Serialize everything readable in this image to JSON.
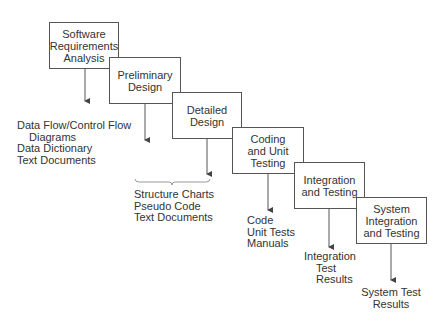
{
  "diagram": {
    "type": "waterfall-process",
    "stages": [
      {
        "id": "s1",
        "lines": [
          "Software",
          "Requirements",
          "Analysis"
        ]
      },
      {
        "id": "s2",
        "lines": [
          "Preliminary",
          "Design"
        ]
      },
      {
        "id": "s3",
        "lines": [
          "Detailed",
          "Design"
        ]
      },
      {
        "id": "s4",
        "lines": [
          "Coding",
          "and Unit",
          "Testing"
        ]
      },
      {
        "id": "s5",
        "lines": [
          "Integration",
          "and Testing"
        ]
      },
      {
        "id": "s6",
        "lines": [
          "System",
          "Integration",
          "and Testing"
        ]
      }
    ],
    "outputs": [
      {
        "stage": "s1",
        "lines": [
          "Data Flow/Control Flow",
          "Diagrams",
          "Data Dictionary",
          "Text Documents"
        ]
      },
      {
        "stage": "s2+s3",
        "lines": [
          "Structure Charts",
          "Pseudo Code",
          "Text Documents"
        ]
      },
      {
        "stage": "s4",
        "lines": [
          "Code",
          "Unit Tests",
          "Manuals"
        ]
      },
      {
        "stage": "s5",
        "lines": [
          "Integration",
          "Test",
          "Results"
        ]
      },
      {
        "stage": "s6",
        "lines": [
          "System Test",
          "Results"
        ]
      }
    ],
    "colors": {
      "line": "#555555",
      "text": "#333333",
      "background": "#ffffff"
    }
  }
}
